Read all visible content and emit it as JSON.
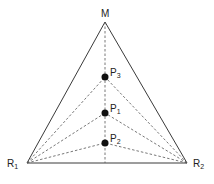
{
  "diagram": {
    "type": "triangle-with-interior-points",
    "vertices": {
      "M": {
        "label": "M",
        "sub": "",
        "x": 105,
        "y": 22
      },
      "R1": {
        "label": "R",
        "sub": "1",
        "x": 27,
        "y": 163
      },
      "R2": {
        "label": "R",
        "sub": "2",
        "x": 187,
        "y": 163
      }
    },
    "points": [
      {
        "id": "P3",
        "label": "P",
        "sub": "3",
        "x": 105,
        "y": 77
      },
      {
        "id": "P1",
        "label": "P",
        "sub": "1",
        "x": 105,
        "y": 113
      },
      {
        "id": "P2",
        "label": "P",
        "sub": "2",
        "x": 105,
        "y": 143
      }
    ],
    "edges_solid": [
      [
        "M",
        "R1"
      ],
      [
        "M",
        "R2"
      ],
      [
        "R1",
        "R2"
      ]
    ],
    "edges_dashed": [
      [
        "M",
        "base-mid"
      ],
      [
        "R1",
        "P3"
      ],
      [
        "R2",
        "P3"
      ],
      [
        "R1",
        "P1"
      ],
      [
        "R2",
        "P1"
      ],
      [
        "R1",
        "P2"
      ],
      [
        "R2",
        "P2"
      ]
    ],
    "colors": {
      "line": "#3a3a3a",
      "dashed": "#555555",
      "dot": "#111111",
      "background": "#ffffff"
    }
  }
}
